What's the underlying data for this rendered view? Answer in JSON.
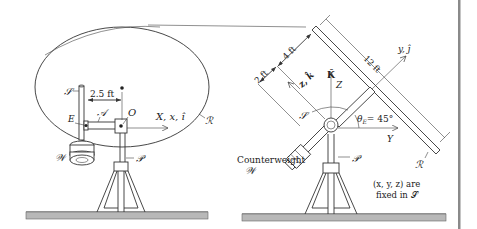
{
  "figure": {
    "left_view": {
      "labels": {
        "shaft": "𝒮",
        "arm": "𝒜",
        "point_E": "E",
        "point_O": "O",
        "counterweight": "𝒲",
        "pedestal": "𝒫",
        "reflector": "ℛ",
        "dimension": "2.5 ft",
        "axis": "X, x, î"
      }
    },
    "right_view": {
      "labels": {
        "dim_2ft": "2 ft",
        "dim_4ft": "4 ft",
        "dim_12ft": "12 ft",
        "axis_y": "y, ĵ",
        "axis_z": "z, k̂",
        "axis_K": "K̂",
        "axis_Z": "Z",
        "axis_Y": "Y",
        "shaft": "𝒮",
        "angle": "θ",
        "angle_sub": "E",
        "angle_value": "= 45°",
        "counterweight_text": "Counterweight",
        "counterweight_symbol": "𝒲",
        "pedestal": "𝒫",
        "reflector": "ℛ",
        "note_line1": "(x, y, z) are",
        "note_line2": "fixed in 𝒮"
      }
    },
    "colors": {
      "line": "#333333",
      "ground": "#b8b8b8",
      "right_rule": "#8a8a8a",
      "background": "#ffffff"
    }
  }
}
